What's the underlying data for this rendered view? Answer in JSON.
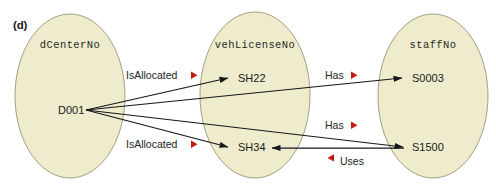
{
  "figure": {
    "panel_label": "(d)",
    "type": "set-mapping-diagram",
    "background_color": "#ffffff",
    "ellipse_fill": "#eeeccc",
    "ellipse_stroke": "#8a8a6a",
    "edge_color": "#17171a",
    "marker_color": "#c21a14"
  },
  "sets": [
    {
      "id": "set-dcenterno",
      "title": "dCenterNo",
      "cx": 70,
      "cy": 96,
      "rx": 55,
      "ry": 82,
      "members": [
        {
          "id": "member-d001",
          "label": "D001",
          "x": 58,
          "y": 114
        }
      ]
    },
    {
      "id": "set-vehlicenseno",
      "title": "vehLicenseNo",
      "cx": 255,
      "cy": 95,
      "rx": 55,
      "ry": 83,
      "members": [
        {
          "id": "member-sh22",
          "label": "SH22",
          "x": 238,
          "y": 82
        },
        {
          "id": "member-sh34",
          "label": "SH34",
          "x": 238,
          "y": 151
        }
      ]
    },
    {
      "id": "set-staffno",
      "title": "staffNo",
      "cx": 433,
      "cy": 96,
      "rx": 55,
      "ry": 82,
      "members": [
        {
          "id": "member-s0003",
          "label": "S0003",
          "x": 412,
          "y": 82
        },
        {
          "id": "member-s1500",
          "label": "S1500",
          "x": 412,
          "y": 151
        }
      ]
    }
  ],
  "relationships": [
    {
      "id": "rel-isallocated-1",
      "label": "IsAllocated",
      "marker": "triangle-right",
      "marker_side": "after",
      "from": "D001",
      "to": "SH22",
      "label_x": 126,
      "label_y": 79
    },
    {
      "id": "rel-has-1",
      "label": "Has",
      "marker": "triangle-right",
      "marker_side": "after",
      "from": "D001",
      "to": "S0003",
      "label_x": 325,
      "label_y": 79
    },
    {
      "id": "rel-isallocated-2",
      "label": "IsAllocated",
      "marker": "triangle-right",
      "marker_side": "after",
      "from": "D001",
      "to": "SH34",
      "label_x": 126,
      "label_y": 148
    },
    {
      "id": "rel-has-2",
      "label": "Has",
      "marker": "triangle-right",
      "marker_side": "after",
      "from": "D001",
      "to": "S1500",
      "label_x": 325,
      "label_y": 129
    },
    {
      "id": "rel-uses",
      "label": "Uses",
      "marker": "triangle-left",
      "marker_side": "before",
      "from": "S1500",
      "to": "SH34",
      "label_x": 340,
      "label_y": 165
    }
  ]
}
